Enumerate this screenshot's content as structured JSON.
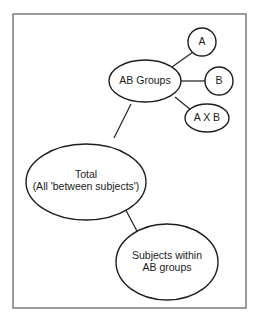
{
  "diagram": {
    "type": "tree",
    "nodes": {
      "a": {
        "label": "A"
      },
      "b": {
        "label": "B"
      },
      "axb": {
        "label": "A X B"
      },
      "ab_groups": {
        "label": "AB Groups"
      },
      "total": {
        "line1": "Total",
        "line2": "(All 'between subjects')"
      },
      "subjects": {
        "line1": "Subjects within",
        "line2": "AB groups"
      }
    },
    "edges": [
      {
        "from": "total",
        "to": "ab_groups"
      },
      {
        "from": "total",
        "to": "subjects"
      },
      {
        "from": "ab_groups",
        "to": "a"
      },
      {
        "from": "ab_groups",
        "to": "b"
      },
      {
        "from": "ab_groups",
        "to": "axb"
      }
    ],
    "colors": {
      "stroke": "#1e1e1e",
      "frame": "#5a5a5a",
      "background": "#ffffff"
    }
  }
}
